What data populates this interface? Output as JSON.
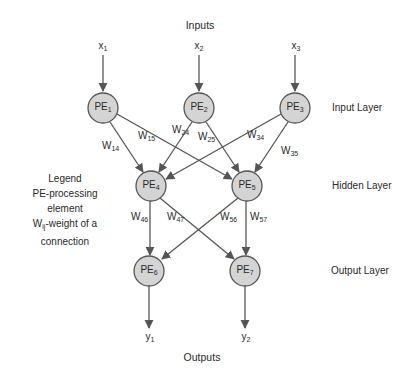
{
  "title_top": "Inputs",
  "title_bottom": "Outputs",
  "layers": [
    {
      "label": "Input Layer"
    },
    {
      "label": "Hidden Layer"
    },
    {
      "label": "Output Layer"
    }
  ],
  "inputs": [
    {
      "base": "x",
      "sub": "1"
    },
    {
      "base": "x",
      "sub": "2"
    },
    {
      "base": "x",
      "sub": "3"
    }
  ],
  "outputs": [
    {
      "base": "y",
      "sub": "1"
    },
    {
      "base": "y",
      "sub": "2"
    }
  ],
  "nodes": [
    {
      "base": "PE",
      "sub": "1"
    },
    {
      "base": "PE",
      "sub": "2"
    },
    {
      "base": "PE",
      "sub": "3"
    },
    {
      "base": "PE",
      "sub": "4"
    },
    {
      "base": "PE",
      "sub": "5"
    },
    {
      "base": "PE",
      "sub": "6"
    },
    {
      "base": "PE",
      "sub": "7"
    }
  ],
  "weights": [
    {
      "base": "W",
      "sub": "14"
    },
    {
      "base": "W",
      "sub": "15"
    },
    {
      "base": "W",
      "sub": "24"
    },
    {
      "base": "W",
      "sub": "25"
    },
    {
      "base": "W",
      "sub": "34"
    },
    {
      "base": "W",
      "sub": "35"
    },
    {
      "base": "W",
      "sub": "46"
    },
    {
      "base": "W",
      "sub": "47"
    },
    {
      "base": "W",
      "sub": "56"
    },
    {
      "base": "W",
      "sub": "57"
    }
  ],
  "legend": {
    "title": "Legend",
    "line1": "PE-processing",
    "line2": "element",
    "line3_base": "W",
    "line3_sub": "ij",
    "line3_rest": "-weight of a",
    "line4": "connection"
  },
  "colors": {
    "node_fill": "#d4d4d4",
    "node_stroke": "#555555",
    "edge": "#555555"
  }
}
